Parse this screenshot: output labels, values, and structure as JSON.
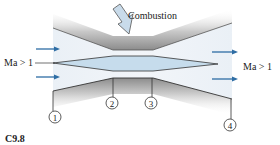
{
  "diagram": {
    "type": "supersonic-combustion-ramjet-schematic",
    "annotation_top": "Combustion",
    "inlet_label": "Ma > 1",
    "outlet_label": "Ma > 1",
    "stations": [
      "1",
      "2",
      "3",
      "4"
    ],
    "figure_caption": "C9.8",
    "colors": {
      "flow_arrow": "#2e6da4",
      "channel_fill": "#eef2f7",
      "center_body_fill": "#c6dcec",
      "wall_shade": "#9a9a9a",
      "outline": "#333333",
      "combustion_arrow_fill": "#c9dbea"
    }
  }
}
